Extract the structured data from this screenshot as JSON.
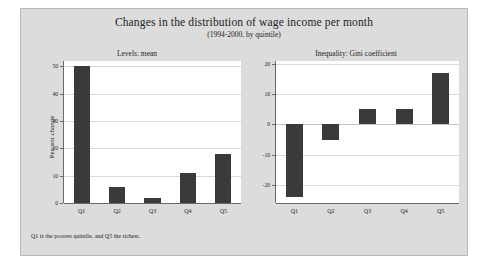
{
  "figure": {
    "title": "Changes in the distribution of wage income per month",
    "subtitle": "(1994-2000, by quintile)",
    "footnote": "Q1 is the poorest quintile, and Q5 the richest.",
    "background_color": "#dcdcdc",
    "bar_color": "#3a3a3a",
    "plot_background_color": "#ffffff"
  },
  "chart_data": [
    {
      "type": "bar",
      "title": "Levels: mean",
      "categories": [
        "Q1",
        "Q2",
        "Q3",
        "Q4",
        "Q5"
      ],
      "values": [
        50,
        6,
        2,
        11,
        18
      ],
      "xlabel": "",
      "ylabel": "Percent change",
      "ylim": [
        0,
        52
      ],
      "yticks": [
        0,
        10,
        20,
        30,
        40,
        50
      ],
      "ytick_labels": [
        "0",
        "10",
        "20",
        "30",
        "40",
        "50"
      ],
      "grid": true,
      "legend": "none"
    },
    {
      "type": "bar",
      "title": "Inequality: Gini coefficient",
      "categories": [
        "Q1",
        "Q2",
        "Q3",
        "Q4",
        "Q5"
      ],
      "values": [
        -24,
        -5,
        5,
        5,
        17
      ],
      "xlabel": "",
      "ylabel": "",
      "ylim": [
        -26,
        21
      ],
      "yticks": [
        -20,
        -10,
        0,
        10,
        20
      ],
      "ytick_labels": [
        "-20",
        "-10",
        "0",
        "10",
        "20"
      ],
      "grid": true,
      "legend": "none"
    }
  ]
}
